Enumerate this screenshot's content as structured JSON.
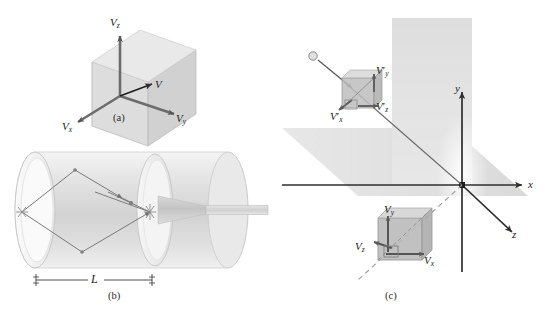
{
  "figure": {
    "background_color": "#ffffff",
    "ink_color": "#4a4a4a",
    "panels": [
      {
        "id": "a",
        "caption": "(a)",
        "description": "cube with velocity component vectors",
        "labels": [
          {
            "name": "v-z",
            "base": "V",
            "sub": "z",
            "prime": false
          },
          {
            "name": "v-y",
            "base": "V",
            "sub": "y",
            "prime": false
          },
          {
            "name": "v-x",
            "base": "V",
            "sub": "x",
            "prime": false
          },
          {
            "name": "v-resultant",
            "base": "V",
            "sub": "",
            "prime": false
          }
        ]
      },
      {
        "id": "b",
        "caption": "(b)",
        "description": "cylinder with molecular trajectories and exit nozzle",
        "dimension_label": "L"
      },
      {
        "id": "c",
        "caption": "(c)",
        "description": "3D axes with two shaded planes and two velocity-component cubes",
        "axes": [
          {
            "name": "x",
            "label": "x"
          },
          {
            "name": "y",
            "label": "y"
          },
          {
            "name": "z",
            "label": "z"
          }
        ],
        "labels": [
          {
            "name": "vp-y",
            "base": "V",
            "sub": "y",
            "prime": true
          },
          {
            "name": "vp-z",
            "base": "V",
            "sub": "z",
            "prime": true
          },
          {
            "name": "vp-x",
            "base": "V",
            "sub": "x",
            "prime": true
          },
          {
            "name": "v-y",
            "base": "V",
            "sub": "y",
            "prime": false
          },
          {
            "name": "v-z",
            "base": "V",
            "sub": "z",
            "prime": false
          },
          {
            "name": "v-x",
            "base": "V",
            "sub": "x",
            "prime": false
          }
        ]
      }
    ],
    "colors": {
      "cube_face_light": "#dcdcdc",
      "cube_face_mid": "#c9c9c9",
      "cube_face_dark": "#b4b4b4",
      "plane_fill": "#e2e2e2",
      "cylinder_fill": "#ededed",
      "vector_stroke": "#6e6e6e",
      "axis_stroke": "#3c3c3c",
      "label_text": "#1c1c1c"
    }
  },
  "panel_a": {
    "caption": "(a)",
    "label_vz": "V",
    "label_vz_sub": "z",
    "label_vy": "V",
    "label_vy_sub": "y",
    "label_vx": "V",
    "label_vx_sub": "x",
    "label_v": "V"
  },
  "panel_b": {
    "caption": "(b)",
    "length_label": "L"
  },
  "panel_c": {
    "caption": "(c)",
    "axis_x": "x",
    "axis_y": "y",
    "axis_z": "z",
    "label_vpy": "V",
    "label_vpy_sub": "y",
    "label_vpz": "V",
    "label_vpz_sub": "z",
    "label_vpx": "V",
    "label_vpx_sub": "x",
    "label_vy": "V",
    "label_vy_sub": "y",
    "label_vz": "V",
    "label_vz_sub": "z",
    "label_vx": "V",
    "label_vx_sub": "x",
    "prime_glyph": "′"
  }
}
